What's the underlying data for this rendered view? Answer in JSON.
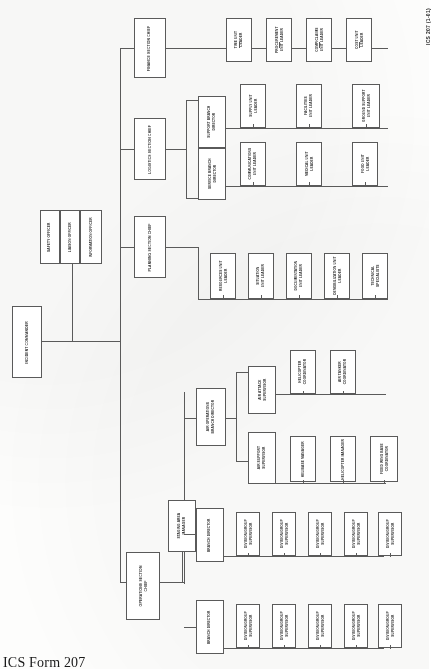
{
  "document": {
    "form_title": "ICS Form 207",
    "form_code": "ICS 207 (1-01)",
    "chart_name": "Incident Organization Chart",
    "orientation": "landscape-rotated"
  },
  "command": {
    "incident_commander": "INCIDENT COMMANDER",
    "staff": [
      {
        "label": "SAFETY OFFICER"
      },
      {
        "label": "LIAISON OFFICER"
      },
      {
        "label": "INFORMATION OFFICER"
      }
    ]
  },
  "sections": {
    "finance": {
      "chief": "FINANCE SECTION CHIEF",
      "units": [
        {
          "label": "TIME UNIT\nLEADER"
        },
        {
          "label": "PROCUREMENT\nUNIT LEADER"
        },
        {
          "label": "COMP/CLAIMS\nUNIT LEADER"
        },
        {
          "label": "COST UNIT\nLEADER"
        }
      ]
    },
    "logistics": {
      "chief": "LOGISTICS SECTION CHIEF",
      "branches": [
        {
          "label": "SUPPORT BRANCH\nDIRECTOR",
          "units": [
            {
              "label": "SUPPLY UNIT\nLEADER"
            },
            {
              "label": "FACILITIES\nUNIT LEADER"
            },
            {
              "label": "GROUND SUPPORT\nUNIT LEADER"
            }
          ]
        },
        {
          "label": "SERVICE BRANCH\nDIRECTOR",
          "units": [
            {
              "label": "COMMUNICATIONS\nUNIT LEADER"
            },
            {
              "label": "MEDICAL UNIT\nLEADER"
            },
            {
              "label": "FOOD UNIT\nLEADER"
            }
          ]
        }
      ]
    },
    "planning": {
      "chief": "PLANNING SECTION CHIEF",
      "units": [
        {
          "label": "RESOURCES UNIT\nLEADER"
        },
        {
          "label": "SITUATION\nUNIT LEADER"
        },
        {
          "label": "DOCUMENTATION\nUNIT LEADER"
        },
        {
          "label": "DEMOBILIZATION UNIT\nLEADER"
        },
        {
          "label": "TECHNICAL\nSPECIALISTS"
        }
      ]
    },
    "operations": {
      "chief": "OPERATIONS SECTION\nCHIEF",
      "staging": "STAGING AREA\nMANAGER",
      "branches": [
        {
          "label": "BRANCH DIRECTOR",
          "units": [
            {
              "label": "DIVISION/GROUP\nSUPERVISOR"
            },
            {
              "label": "DIVISION/GROUP\nSUPERVISOR"
            },
            {
              "label": "DIVISION/GROUP\nSUPERVISOR"
            },
            {
              "label": "DIVISION/GROUP\nSUPERVISOR"
            },
            {
              "label": "DIVISION/GROUP\nSUPERVISOR"
            }
          ]
        },
        {
          "label": "BRANCH DIRECTOR",
          "units": [
            {
              "label": "DIVISION/GROUP\nSUPERVISOR"
            },
            {
              "label": "DIVISION/GROUP\nSUPERVISOR"
            },
            {
              "label": "DIVISION/GROUP\nSUPERVISOR"
            },
            {
              "label": "DIVISION/GROUP\nSUPERVISOR"
            },
            {
              "label": "DIVISION/GROUP\nSUPERVISOR"
            }
          ]
        }
      ],
      "air_operations": {
        "label": "AIR OPERATIONS\nBRANCH DIRECTOR",
        "groups": [
          {
            "label": "AIR SUPPORT\nSUPERVISOR",
            "units": [
              {
                "label": "HELIBASE MANAGER"
              },
              {
                "label": "HELICOPTER MANAGER"
              },
              {
                "label": "FIXED WING BASE\nCOORDINATOR"
              }
            ]
          },
          {
            "label": "AIR ATTACK\nSUPERVISOR",
            "units": [
              {
                "label": "HELICOPTER\nCOORDINATOR"
              },
              {
                "label": "AIR TANKER\nCOORDINATOR"
              }
            ]
          }
        ]
      }
    }
  },
  "colors": {
    "line": "#5a5a5a",
    "text": "#2b2b2b",
    "page": "#fdfdfc"
  }
}
